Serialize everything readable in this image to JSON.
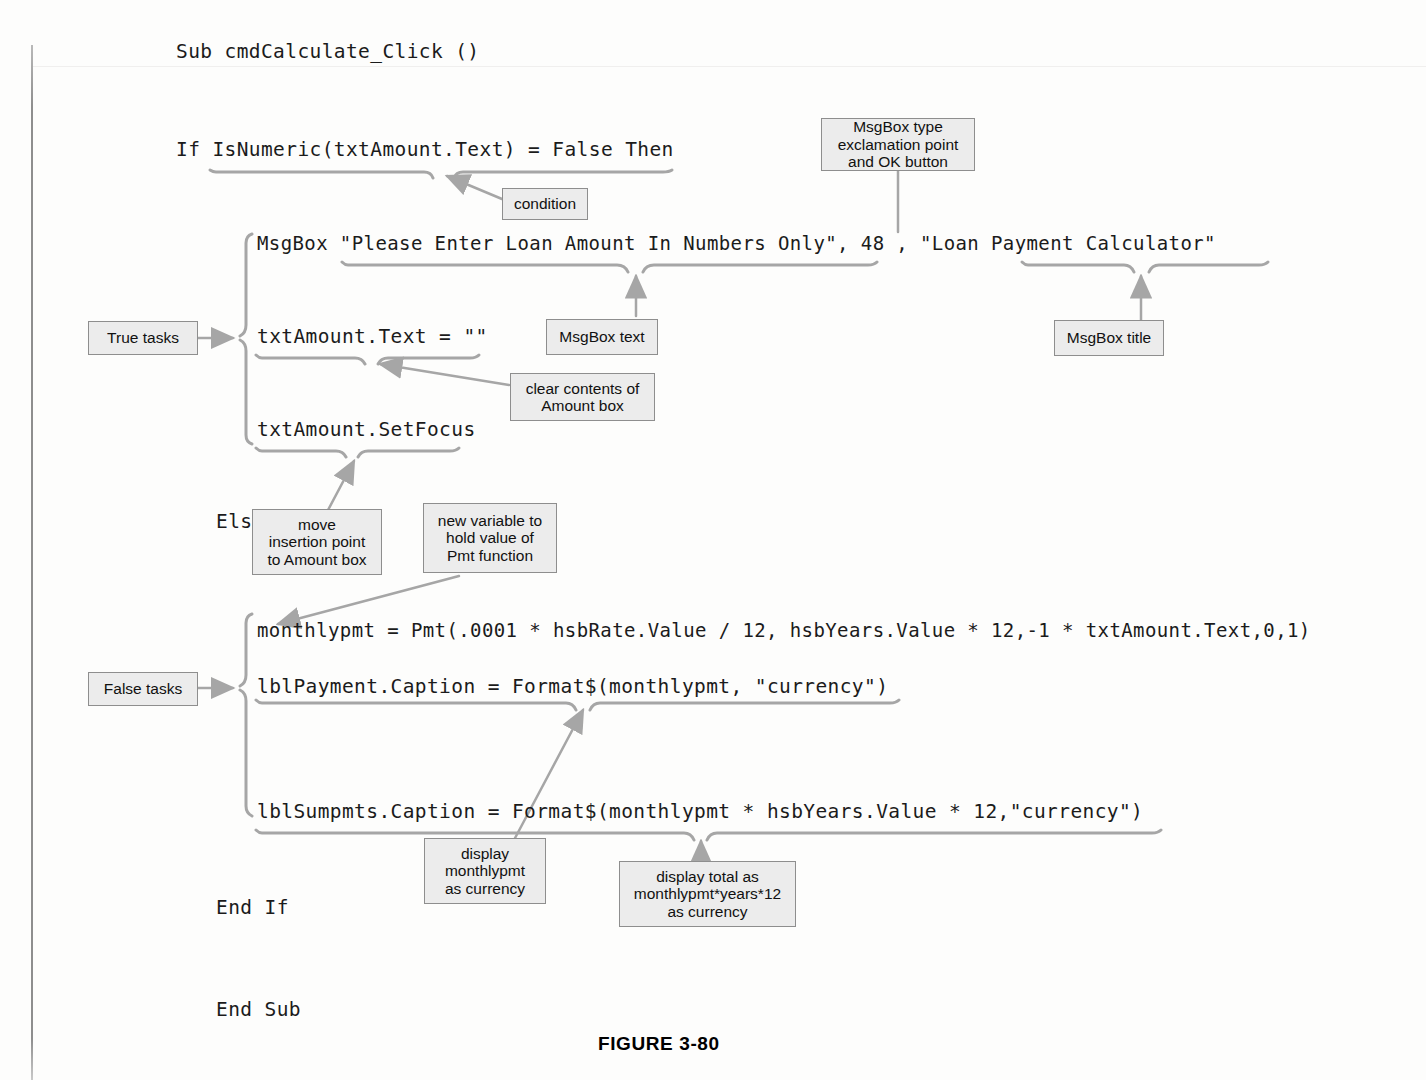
{
  "figure": {
    "caption": "FIGURE 3-80"
  },
  "code": {
    "lines": [
      {
        "id": "sub-header",
        "text": "Sub cmdCalculate_Click ()"
      },
      {
        "id": "if-condition",
        "text": "If IsNumeric(txtAmount.Text) = False Then"
      },
      {
        "id": "msgbox-call",
        "text": "MsgBox \"Please Enter Loan Amount In Numbers Only\", 48 , \"Loan Payment Calculator\""
      },
      {
        "id": "clear-amount",
        "text": "txtAmount.Text = \"\""
      },
      {
        "id": "set-focus",
        "text": "txtAmount.SetFocus"
      },
      {
        "id": "else",
        "text": "Else"
      },
      {
        "id": "pmt-calculation",
        "text": "monthlypmt = Pmt(.0001 * hsbRate.Value / 12, hsbYears.Value * 12,-1 * txtAmount.Text,0,1)"
      },
      {
        "id": "payment-caption",
        "text": "lblPayment.Caption = Format$(monthlypmt, \"currency\")"
      },
      {
        "id": "sumpmts-caption",
        "text": "lblSumpmts.Caption = Format$(monthlypmt * hsbYears.Value * 12,\"currency\")"
      },
      {
        "id": "end-if",
        "text": "End If"
      },
      {
        "id": "end-sub",
        "text": "End Sub"
      }
    ]
  },
  "callouts": [
    {
      "id": "condition",
      "text": "condition"
    },
    {
      "id": "msgbox-type",
      "text": "MsgBox type\nexclamation point\nand OK button"
    },
    {
      "id": "true-tasks",
      "text": "True tasks"
    },
    {
      "id": "msgbox-text",
      "text": "MsgBox text"
    },
    {
      "id": "msgbox-title",
      "text": "MsgBox title"
    },
    {
      "id": "clear-contents",
      "text": "clear contents of\nAmount box"
    },
    {
      "id": "move-insertion",
      "text": "move\ninsertion point\nto Amount box"
    },
    {
      "id": "new-variable",
      "text": "new variable to\nhold value of\nPmt function"
    },
    {
      "id": "false-tasks",
      "text": "False tasks"
    },
    {
      "id": "display-monthly",
      "text": "display\nmonthlypmt\nas currency"
    },
    {
      "id": "display-total",
      "text": "display total as\nmonthlypmt*years*12\nas currency"
    }
  ],
  "colors": {
    "callout_fill": "#ececec",
    "callout_border": "#8e8e8e",
    "annotation_line": "#9a9a9a",
    "text": "#1b1b1b",
    "page_background": "#fdfdfc"
  }
}
